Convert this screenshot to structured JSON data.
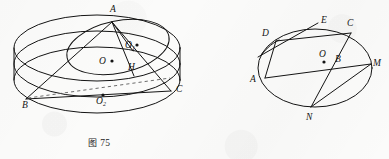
{
  "page": {
    "background_color": "#fbfbfa",
    "ink_color": "#141414",
    "width": 389,
    "height": 159,
    "kind": "scanned-geometry-figures"
  },
  "figures": [
    {
      "id": "fig-75",
      "caption_prefix": "图",
      "caption_number": "75",
      "caption": "图 75",
      "description": "cylinder-with-inscribed-triangle-and-circle",
      "point_labels": [
        {
          "name": "A",
          "text": "A",
          "sub": "",
          "x": 110,
          "y": 12
        },
        {
          "name": "B",
          "text": "B",
          "sub": "",
          "x": 22,
          "y": 104
        },
        {
          "name": "C",
          "text": "C",
          "sub": "",
          "x": 176,
          "y": 89
        },
        {
          "name": "O",
          "text": "O",
          "sub": "",
          "x": 100,
          "y": 62
        },
        {
          "name": "O1",
          "text": "O",
          "sub": "1",
          "x": 126,
          "y": 46
        },
        {
          "name": "O2",
          "text": "O",
          "sub": "2",
          "x": 98,
          "y": 101
        },
        {
          "name": "H",
          "text": "H",
          "sub": "",
          "x": 131,
          "y": 68
        }
      ],
      "dotted_points": [
        "O",
        "O1",
        "O2"
      ],
      "dashed_segments": [
        "B-H-to-C-region"
      ]
    },
    {
      "id": "fig-76",
      "caption_prefix": "图",
      "caption_number": "76",
      "caption": "图 76",
      "description": "ellipse-with-chords-and-tangent",
      "point_labels": [
        {
          "name": "A",
          "text": "A",
          "sub": "",
          "x": 57,
          "y": 78
        },
        {
          "name": "B",
          "text": "B",
          "sub": "",
          "x": 143,
          "y": 62
        },
        {
          "name": "C",
          "text": "C",
          "sub": "",
          "x": 148,
          "y": 24
        },
        {
          "name": "D",
          "text": "D",
          "sub": "",
          "x": 69,
          "y": 34
        },
        {
          "name": "E",
          "text": "E",
          "sub": "",
          "x": 125,
          "y": 21
        },
        {
          "name": "M",
          "text": "M",
          "sub": "",
          "x": 177,
          "y": 63
        },
        {
          "name": "N",
          "text": "N",
          "sub": "",
          "x": 113,
          "y": 122
        },
        {
          "name": "O",
          "text": "O",
          "sub": "",
          "x": 125,
          "y": 58
        }
      ],
      "dotted_points": [
        "O"
      ],
      "chords": [
        "D-A",
        "D-C",
        "A-M",
        "N-C",
        "N-M"
      ],
      "tangent_line": "through-D-towards-E"
    }
  ]
}
